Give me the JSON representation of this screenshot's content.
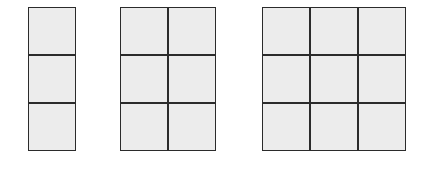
{
  "diagram": {
    "background_color": "#ffffff",
    "cell_fill_color": "#ececec",
    "line_color": "#2b2b2b",
    "cell_size_px": 46,
    "line_width_px": 2,
    "figure_count": 3,
    "figures": [
      {
        "id": "figure-a",
        "label": "",
        "columns": 1,
        "rows": 3,
        "cell_count": 3,
        "x": 28,
        "y": 7,
        "width": 48,
        "height": 144
      },
      {
        "id": "figure-b",
        "label": "",
        "columns": 2,
        "rows": 3,
        "cell_count": 6,
        "x": 120,
        "y": 7,
        "width": 96,
        "height": 144
      },
      {
        "id": "figure-c",
        "label": "",
        "columns": 3,
        "rows": 3,
        "cell_count": 9,
        "x": 262,
        "y": 7,
        "width": 144,
        "height": 144
      }
    ]
  }
}
